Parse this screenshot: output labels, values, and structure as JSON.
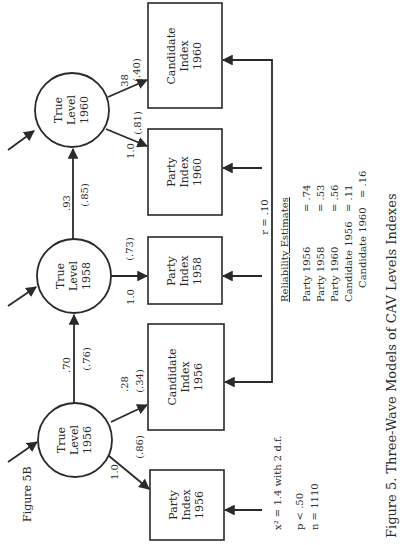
{
  "figure": {
    "label": "Figure 5B",
    "caption": "Figure 5.  Three-Wave Models of CAV Levels Indexes"
  },
  "nodes": {
    "true_1956": {
      "line1": "True",
      "line2": "Level",
      "line3": "1956"
    },
    "true_1958": {
      "line1": "True",
      "line2": "Level",
      "line3": "1958"
    },
    "true_1960": {
      "line1": "True",
      "line2": "Level",
      "line3": "1960"
    },
    "party_1956": {
      "line1": "Party",
      "line2": "Index",
      "line3": "1956"
    },
    "candidate_1956": {
      "line1": "Candidate",
      "line2": "Index",
      "line3": "1956"
    },
    "party_1958": {
      "line1": "Party",
      "line2": "Index",
      "line3": "1958"
    },
    "party_1960": {
      "line1": "Party",
      "line2": "Index",
      "line3": "1960"
    },
    "candidate_1960": {
      "line1": "Candidate",
      "line2": "Index",
      "line3": "1960"
    }
  },
  "paths": {
    "t56_p56": {
      "coef": "1.0",
      "std": "(.86)"
    },
    "t56_c56": {
      "coef": ".28",
      "std": "(.34)"
    },
    "t56_t58": {
      "coef": ".70",
      "std": "(.76)"
    },
    "t58_p58": {
      "coef": "1.0",
      "std": "(.73)"
    },
    "t58_t60": {
      "coef": ".93",
      "std": "(.85)"
    },
    "t60_p60": {
      "coef": "1.0",
      "std": "(.81)"
    },
    "t60_c60": {
      "coef": ".38",
      "std": "(.40)"
    },
    "c56_c60_corr": "r = .10"
  },
  "fit": {
    "chi_square": "x² = 1.4 with 2 d.f.",
    "p": "p < .50",
    "n": "n = 1110"
  },
  "reliability": {
    "title": "Reliability Estimates",
    "rows": [
      {
        "label": "Party 1956",
        "value": "= .74"
      },
      {
        "label": "Party 1958",
        "value": "= .53"
      },
      {
        "label": "Party 1960",
        "value": "= .56"
      },
      {
        "label": "Candidate 1956",
        "value": "= .11"
      },
      {
        "label": "Candidate 1960",
        "value": "= .16"
      }
    ]
  }
}
